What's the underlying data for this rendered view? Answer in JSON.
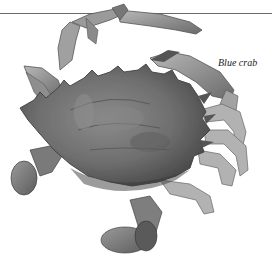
{
  "figure": {
    "caption": "Blue crab",
    "palette": {
      "background": "#ffffff",
      "rule": "#6a6a6a",
      "shell_dark": "#4a4a4a",
      "shell_mid": "#7a7a7a",
      "shell_light": "#a8a8a8",
      "leg_light": "#bdbdbd",
      "caption": "#222222"
    }
  }
}
